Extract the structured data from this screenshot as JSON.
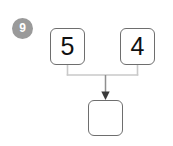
{
  "diagram": {
    "type": "number-bond-addition",
    "badge": {
      "label": "9",
      "shape": "circle",
      "fill_color": "#9a9a9a",
      "text_color": "#ffffff"
    },
    "addends": [
      {
        "value": "5",
        "position": "left"
      },
      {
        "value": "4",
        "position": "right"
      }
    ],
    "result_box": {
      "value": "",
      "position": "bottom",
      "state": "empty"
    },
    "connector": {
      "style": "bracket-with-arrow",
      "arrow_direction": "down",
      "line_color": "#c9c9c9",
      "arrow_color": "#8a8a8a"
    },
    "colors": {
      "box_border": "#6e6e6e",
      "box_fill": "#ffffff",
      "digit": "#111111",
      "background": "#ffffff"
    }
  }
}
